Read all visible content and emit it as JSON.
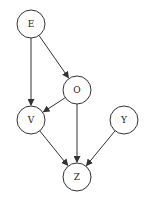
{
  "diagram": {
    "type": "directed-graph",
    "nodes": [
      {
        "id": "E",
        "label": "E",
        "cx": 31,
        "cy": 24
      },
      {
        "id": "O",
        "label": "O",
        "cx": 77,
        "cy": 90
      },
      {
        "id": "V",
        "label": "V",
        "cx": 31,
        "cy": 120
      },
      {
        "id": "Y",
        "label": "Y",
        "cx": 124,
        "cy": 120
      },
      {
        "id": "Z",
        "label": "Z",
        "cx": 77,
        "cy": 177
      }
    ],
    "edges": [
      {
        "from": "E",
        "to": "V"
      },
      {
        "from": "E",
        "to": "O"
      },
      {
        "from": "O",
        "to": "V"
      },
      {
        "from": "O",
        "to": "Z"
      },
      {
        "from": "V",
        "to": "Z"
      },
      {
        "from": "Y",
        "to": "Z"
      }
    ]
  }
}
